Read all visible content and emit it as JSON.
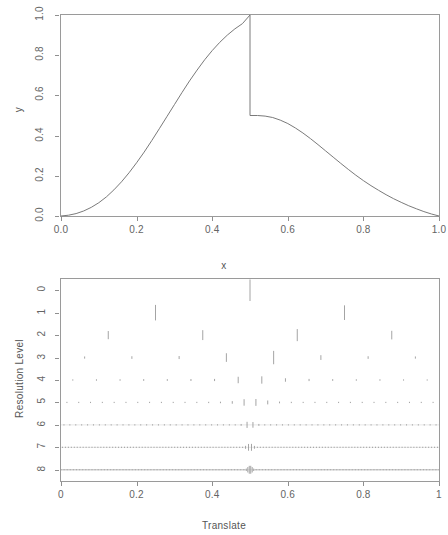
{
  "figure": {
    "title": "",
    "background_color": "#ffffff",
    "line_color": "#7a7a7a",
    "axis_color": "#8f8f8f",
    "text_color": "#5f5f5f"
  },
  "top_panel": {
    "xlabel": "x",
    "ylabel": "y",
    "x_ticks": [
      "0.0",
      "0.2",
      "0.4",
      "0.6",
      "0.8",
      "1.0"
    ],
    "y_ticks": [
      "0.0",
      "0.2",
      "0.4",
      "0.6",
      "0.8",
      "1.0"
    ]
  },
  "bottom_panel": {
    "xlabel": "Translate",
    "ylabel": "Resolution Level",
    "x_ticks": [
      "0",
      "0.2",
      "0.4",
      "0.6",
      "0.8",
      "1"
    ],
    "y_ticks": [
      "0",
      "1",
      "2",
      "3",
      "4",
      "5",
      "6",
      "7",
      "8"
    ]
  },
  "chart_data": [
    {
      "type": "line",
      "title": "",
      "xlabel": "x",
      "ylabel": "y",
      "xlim": [
        0.0,
        1.0
      ],
      "ylim": [
        0.0,
        1.0
      ],
      "grid": false,
      "legend": "none",
      "description": "Piecewise smooth function with a jump discontinuity at x = 0.5: rises from 0 to 1 on [0,0.5), drops to 0.5 at x = 0.5, then decays back to 0 at x = 1.",
      "series": [
        {
          "name": "y(x)",
          "x": [
            0.0,
            0.02,
            0.04,
            0.06,
            0.08,
            0.1,
            0.12,
            0.14,
            0.16,
            0.18,
            0.2,
            0.22,
            0.24,
            0.26,
            0.28,
            0.3,
            0.32,
            0.34,
            0.36,
            0.38,
            0.4,
            0.42,
            0.44,
            0.46,
            0.48,
            0.5,
            0.5,
            0.52,
            0.54,
            0.56,
            0.58,
            0.6,
            0.62,
            0.64,
            0.66,
            0.68,
            0.7,
            0.72,
            0.74,
            0.76,
            0.78,
            0.8,
            0.82,
            0.84,
            0.86,
            0.88,
            0.9,
            0.92,
            0.94,
            0.96,
            0.98,
            1.0
          ],
          "y": [
            0.0,
            0.004,
            0.012,
            0.025,
            0.043,
            0.066,
            0.095,
            0.13,
            0.17,
            0.215,
            0.265,
            0.318,
            0.375,
            0.434,
            0.494,
            0.554,
            0.614,
            0.672,
            0.726,
            0.777,
            0.823,
            0.864,
            0.9,
            0.931,
            0.957,
            1.0,
            0.5,
            0.5,
            0.497,
            0.49,
            0.477,
            0.46,
            0.438,
            0.413,
            0.385,
            0.355,
            0.324,
            0.293,
            0.262,
            0.232,
            0.203,
            0.176,
            0.151,
            0.128,
            0.106,
            0.086,
            0.068,
            0.051,
            0.036,
            0.022,
            0.01,
            0.0
          ]
        }
      ]
    },
    {
      "type": "scatter",
      "title": "",
      "xlabel": "Translate",
      "ylabel": "Resolution Level",
      "xlim": [
        0.0,
        1.0
      ],
      "ylim": [
        0,
        8
      ],
      "grid": false,
      "legend": "none",
      "description": "Discrete wavelet transform coefficient plot. Each resolution level row draws vertical spikes at translate positions; spike magnitude concentrates at the discontinuity near translate = 0.5. Levels run 0 (coarsest, top) through 8 (finest, bottom).",
      "levels": [
        {
          "level": 0,
          "coefficients": [
            {
              "x": 0.5,
              "mag": 1.0
            }
          ]
        },
        {
          "level": 1,
          "coefficients": [
            {
              "x": 0.25,
              "mag": 0.72
            },
            {
              "x": 0.75,
              "mag": 0.68
            }
          ]
        },
        {
          "level": 2,
          "coefficients": [
            {
              "x": 0.125,
              "mag": 0.38
            },
            {
              "x": 0.375,
              "mag": 0.46
            },
            {
              "x": 0.625,
              "mag": 0.56
            },
            {
              "x": 0.875,
              "mag": 0.4
            }
          ]
        },
        {
          "level": 3,
          "coefficients": [
            {
              "x": 0.0625,
              "mag": 0.1
            },
            {
              "x": 0.1875,
              "mag": 0.12
            },
            {
              "x": 0.3125,
              "mag": 0.14
            },
            {
              "x": 0.4375,
              "mag": 0.4
            },
            {
              "x": 0.5625,
              "mag": 0.62
            },
            {
              "x": 0.6875,
              "mag": 0.22
            },
            {
              "x": 0.8125,
              "mag": 0.12
            },
            {
              "x": 0.9375,
              "mag": 0.1
            }
          ]
        },
        {
          "level": 4,
          "coefficients": [
            {
              "x": 0.03125,
              "mag": 0.06
            },
            {
              "x": 0.09375,
              "mag": 0.07
            },
            {
              "x": 0.15625,
              "mag": 0.07
            },
            {
              "x": 0.21875,
              "mag": 0.08
            },
            {
              "x": 0.28125,
              "mag": 0.08
            },
            {
              "x": 0.34375,
              "mag": 0.09
            },
            {
              "x": 0.40625,
              "mag": 0.1
            },
            {
              "x": 0.46875,
              "mag": 0.3
            },
            {
              "x": 0.53125,
              "mag": 0.34
            },
            {
              "x": 0.59375,
              "mag": 0.16
            },
            {
              "x": 0.65625,
              "mag": 0.1
            },
            {
              "x": 0.71875,
              "mag": 0.08
            },
            {
              "x": 0.78125,
              "mag": 0.07
            },
            {
              "x": 0.84375,
              "mag": 0.07
            },
            {
              "x": 0.90625,
              "mag": 0.06
            },
            {
              "x": 0.96875,
              "mag": 0.05
            }
          ]
        },
        {
          "level": 5,
          "coefficients": [
            {
              "x": 0.015625,
              "mag": 0.04
            },
            {
              "x": 0.046875,
              "mag": 0.04
            },
            {
              "x": 0.078125,
              "mag": 0.05
            },
            {
              "x": 0.109375,
              "mag": 0.05
            },
            {
              "x": 0.140625,
              "mag": 0.05
            },
            {
              "x": 0.171875,
              "mag": 0.05
            },
            {
              "x": 0.203125,
              "mag": 0.05
            },
            {
              "x": 0.234375,
              "mag": 0.05
            },
            {
              "x": 0.265625,
              "mag": 0.05
            },
            {
              "x": 0.296875,
              "mag": 0.05
            },
            {
              "x": 0.328125,
              "mag": 0.05
            },
            {
              "x": 0.359375,
              "mag": 0.05
            },
            {
              "x": 0.390625,
              "mag": 0.06
            },
            {
              "x": 0.421875,
              "mag": 0.07
            },
            {
              "x": 0.453125,
              "mag": 0.12
            },
            {
              "x": 0.484375,
              "mag": 0.3
            },
            {
              "x": 0.515625,
              "mag": 0.32
            },
            {
              "x": 0.546875,
              "mag": 0.18
            },
            {
              "x": 0.578125,
              "mag": 0.08
            },
            {
              "x": 0.609375,
              "mag": 0.06
            },
            {
              "x": 0.640625,
              "mag": 0.05
            },
            {
              "x": 0.671875,
              "mag": 0.05
            },
            {
              "x": 0.703125,
              "mag": 0.05
            },
            {
              "x": 0.734375,
              "mag": 0.05
            },
            {
              "x": 0.765625,
              "mag": 0.05
            },
            {
              "x": 0.796875,
              "mag": 0.04
            },
            {
              "x": 0.828125,
              "mag": 0.04
            },
            {
              "x": 0.859375,
              "mag": 0.04
            },
            {
              "x": 0.890625,
              "mag": 0.04
            },
            {
              "x": 0.921875,
              "mag": 0.04
            },
            {
              "x": 0.953125,
              "mag": 0.03
            },
            {
              "x": 0.984375,
              "mag": 0.03
            }
          ]
        },
        {
          "level": 6,
          "n_coefficients": 64,
          "baseline_mag": 0.03,
          "peak_x": 0.5,
          "peak_mag": 0.3,
          "comment": "64 small uniformly spaced spikes forming a dotted band, with a taller spike near translate 0.5"
        },
        {
          "level": 7,
          "n_coefficients": 128,
          "baseline_mag": 0.012,
          "peak_x": 0.5,
          "peak_mag": 0.34,
          "comment": "128 very small spikes forming a near-flat line, with a localized burst at translate 0.5"
        },
        {
          "level": 8,
          "n_coefficients": 256,
          "baseline_mag": 0.006,
          "peak_x": 0.5,
          "peak_mag": 0.38,
          "comment": "256 negligible spikes forming a flat line, with a single tall spike at translate 0.5"
        }
      ]
    }
  ]
}
